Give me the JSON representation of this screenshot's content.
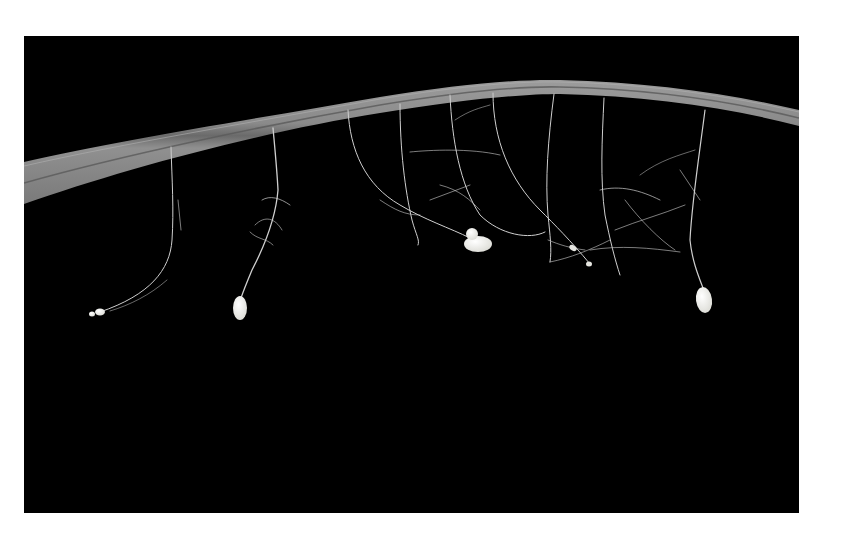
{
  "image": {
    "description": "Stalked white insect eggs hanging on silk threads from the underside of a curved grass leaf against a black background",
    "caption": "",
    "colors": {
      "border": "#ffffff",
      "background": "#000000",
      "leaf": "#8c8c8c",
      "leaf_light": "#a5a5a5",
      "leaf_midrib": "#5e5e5e",
      "thread": "#cfcfcf",
      "egg": "#f4f4f0"
    },
    "subjects": [
      {
        "name": "leaf-blade",
        "type": "leaf"
      },
      {
        "name": "egg-1",
        "type": "broken-egg",
        "x": 97,
        "y": 313
      },
      {
        "name": "egg-2",
        "type": "stalked-egg",
        "x": 240,
        "y": 308
      },
      {
        "name": "egg-cluster",
        "type": "hatched-egg-cluster",
        "x": 477,
        "y": 242
      },
      {
        "name": "egg-4",
        "type": "stalked-egg",
        "x": 704,
        "y": 300
      }
    ]
  }
}
